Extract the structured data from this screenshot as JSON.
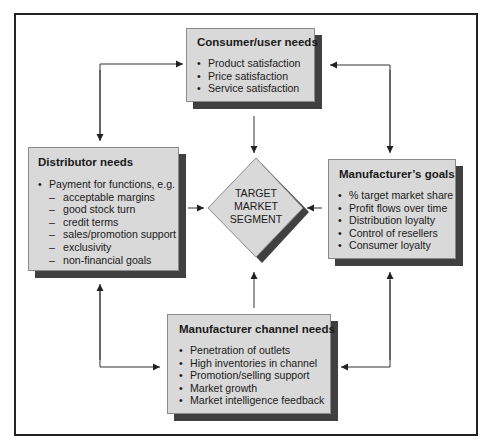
{
  "diagram": {
    "center": {
      "label_lines": [
        "TARGET",
        "MARKET",
        "SEGMENT"
      ]
    },
    "consumer": {
      "title": "Consumer/user needs",
      "items": [
        "Product satisfaction",
        "Price satisfaction",
        "Service satisfaction"
      ]
    },
    "distributor": {
      "title": "Distributor needs",
      "items": [
        {
          "type": "bullet",
          "text": "Payment for functions, e.g."
        },
        {
          "type": "sub",
          "text": "acceptable margins"
        },
        {
          "type": "sub",
          "text": "good stock turn"
        },
        {
          "type": "sub",
          "text": "credit terms"
        },
        {
          "type": "sub",
          "text": "sales/promotion support"
        },
        {
          "type": "sub",
          "text": "exclusivity"
        },
        {
          "type": "sub",
          "text": "non-financial goals"
        }
      ],
      "sub_marker": "–"
    },
    "manufacturer_goals": {
      "title": "Manufacturer’s goals",
      "items": [
        "% target market share",
        "Profit flows over time",
        "Distribution loyalty",
        "Control of resellers",
        "Consumer loyalty"
      ]
    },
    "channel_needs": {
      "title": "Manufacturer channel needs",
      "items": [
        "Penetration of outlets",
        "High inventories in channel",
        "Promotion/selling support",
        "Market growth",
        "Market intelligence feedback"
      ]
    },
    "colors": {
      "box_fill": "#d9d9d9",
      "shadow": "#404040",
      "line": "#333333",
      "frame": "#222222"
    }
  }
}
